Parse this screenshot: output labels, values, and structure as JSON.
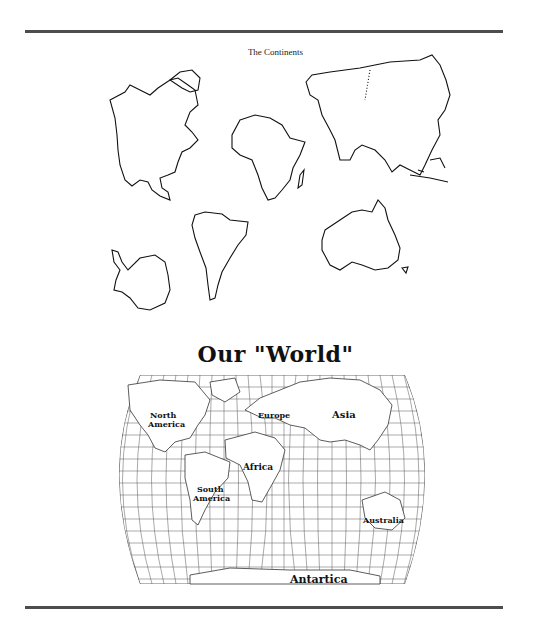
{
  "top_section": {
    "title": "The Continents",
    "continents": [
      "North America",
      "Europe & Asia",
      "Africa",
      "South America",
      "Antarctica",
      "Australia"
    ]
  },
  "bottom_section": {
    "title": "Our \"World\"",
    "labels": {
      "north_america_1": "North",
      "north_america_2": "America",
      "europe": "Europe",
      "asia": "Asia",
      "africa": "Africa",
      "south_america_1": "South",
      "south_america_2": "America",
      "australia": "Australia",
      "antarctica": "Antartica"
    }
  }
}
